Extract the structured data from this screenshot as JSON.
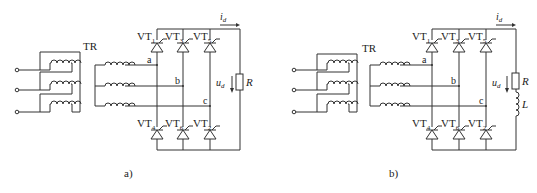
{
  "figure": {
    "panels": [
      {
        "id": "a",
        "caption": "a)",
        "transformer_label": "TR",
        "phases": [
          "a",
          "b",
          "c"
        ],
        "thyristors_top": [
          {
            "name": "VT",
            "sub": "1"
          },
          {
            "name": "VT",
            "sub": "3"
          },
          {
            "name": "VT",
            "sub": "5"
          }
        ],
        "thyristors_bottom": [
          {
            "name": "VT",
            "sub": "4"
          },
          {
            "name": "VT",
            "sub": "6"
          },
          {
            "name": "VT",
            "sub": "2"
          }
        ],
        "current_label": {
          "main": "i",
          "sub": "d"
        },
        "voltage_label": {
          "main": "u",
          "sub": "d"
        },
        "load": [
          {
            "type": "resistor",
            "label": "R"
          }
        ]
      },
      {
        "id": "b",
        "caption": "b)",
        "transformer_label": "TR",
        "phases": [
          "a",
          "b",
          "c"
        ],
        "thyristors_top": [
          {
            "name": "VT",
            "sub": "1"
          },
          {
            "name": "VT",
            "sub": "3"
          },
          {
            "name": "VT",
            "sub": "5"
          }
        ],
        "thyristors_bottom": [
          {
            "name": "VT",
            "sub": "4"
          },
          {
            "name": "VT",
            "sub": "6"
          },
          {
            "name": "VT",
            "sub": "2"
          }
        ],
        "current_label": {
          "main": "i",
          "sub": "d"
        },
        "voltage_label": {
          "main": "u",
          "sub": "d"
        },
        "load": [
          {
            "type": "resistor",
            "label": "R"
          },
          {
            "type": "inductor",
            "label": "L"
          }
        ]
      }
    ]
  }
}
